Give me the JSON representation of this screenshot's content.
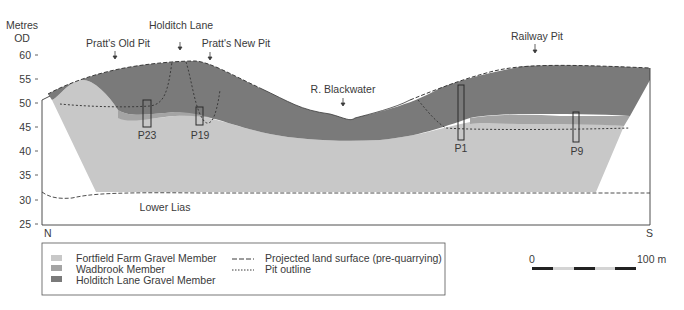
{
  "figure": {
    "y_axis": {
      "title_line1": "Metres",
      "title_line2": "OD",
      "ticks": [
        "60",
        "55",
        "50",
        "45",
        "40",
        "35",
        "30",
        "25"
      ]
    },
    "orientation": {
      "left": "N",
      "right": "S"
    },
    "site_labels": {
      "pratts_old_pit": "Pratt's Old Pit",
      "holditch_lane": "Holditch Lane",
      "pratts_new_pit": "Pratt's New Pit",
      "r_blackwater": "R. Blackwater",
      "railway_pit": "Railway Pit"
    },
    "boreholes": {
      "p23": "P23",
      "p19": "P19",
      "p1": "P1",
      "p9": "P9"
    },
    "bedrock_label": "Lower Lias",
    "legend": {
      "units": [
        {
          "label": "Fortfield Farm Gravel Member",
          "color": "#c8c8c8"
        },
        {
          "label": "Wadbrook Member",
          "color": "#a4a4a4"
        },
        {
          "label": "Holditch Lane Gravel Member",
          "color": "#7a7a7a"
        }
      ],
      "lines": [
        {
          "label": "Projected land surface (pre-quarrying)",
          "style": "dashed"
        },
        {
          "label": "Pit outline",
          "style": "dotted"
        }
      ]
    },
    "scale_bar": {
      "start_label": "0",
      "end_label": "100 m"
    },
    "colors": {
      "fortfield": "#c8c8c8",
      "wadbrook": "#a4a4a4",
      "holditch": "#7a7a7a",
      "line": "#3a3a3a"
    }
  }
}
